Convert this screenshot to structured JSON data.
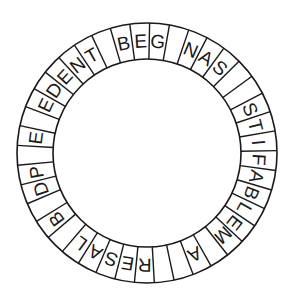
{
  "diagram": {
    "type": "letter-ring",
    "center": [
      147,
      153
    ],
    "outer_radius": 130,
    "inner_radius": 94,
    "start_angle_deg": -16.4,
    "stroke_color": "#1a1a1a",
    "segments": [
      "B",
      "E",
      "G",
      "",
      "N",
      "A",
      "S",
      "",
      "",
      "S",
      "T",
      "I",
      "F",
      "A",
      "B",
      "L",
      "E",
      "M",
      "",
      "A",
      "",
      "",
      "R",
      "E",
      "S",
      "A",
      "L",
      "",
      "B",
      "",
      "D",
      "P",
      "",
      "E",
      "",
      "E",
      "D",
      "E",
      "N",
      "T",
      ""
    ]
  }
}
